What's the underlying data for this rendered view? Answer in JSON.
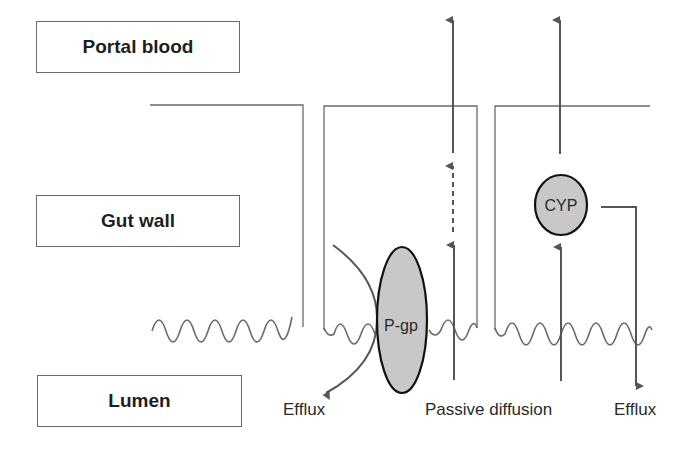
{
  "regions": {
    "portal_blood": "Portal blood",
    "gut_wall": "Gut wall",
    "lumen": "Lumen"
  },
  "nodes": {
    "pgp": "P-gp",
    "cyp": "CYP"
  },
  "captions": {
    "efflux_left": "Efflux",
    "passive_diffusion": "Passive diffusion",
    "efflux_right": "Efflux"
  },
  "colors": {
    "line": "#6a6a6a",
    "arrow": "#555555",
    "node_fill": "#c8c8c8",
    "node_stroke": "#111111"
  }
}
